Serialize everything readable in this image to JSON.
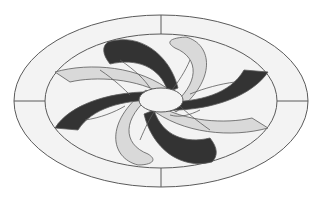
{
  "title": "Oval pinwheel medallion pattern",
  "colors": {
    "background": "#ffffff",
    "field": "#f3f3f3",
    "dark_petal": "#333333",
    "light_petal": "#d9d9d9",
    "line": "#5a5a5a"
  },
  "design": {
    "outer_ellipse": {
      "cx": 161,
      "cy": 101,
      "rx": 147,
      "ry": 86
    },
    "inner_ellipse": {
      "cx": 161,
      "cy": 101,
      "rx": 116,
      "ry": 67
    },
    "center_ellipse": {
      "cx": 161,
      "cy": 100,
      "rx": 22,
      "ry": 12
    },
    "petal_count": 8,
    "petal_pattern": "alternating dark and light",
    "dividers": [
      "top",
      "bottom",
      "left",
      "right"
    ]
  }
}
